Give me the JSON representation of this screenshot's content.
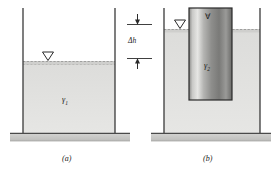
{
  "figure": {
    "title_visible": false,
    "panels": [
      {
        "id": "a",
        "caption": "(a)",
        "fluid_symbol": "γ",
        "fluid_subscript": "1",
        "free_surface_marker": "free-surface-triangle",
        "description_visible_text": "γ₁"
      },
      {
        "id": "b",
        "caption": "(b)",
        "fluid_symbol": "γ",
        "fluid_subscript": "1",
        "block_volume_symbol": "∀",
        "block_weight_symbol": "γ",
        "block_weight_subscript": "2",
        "free_surface_marker": "free-surface-triangle",
        "description_visible_text": "∀, γ₂"
      }
    ],
    "dimension": {
      "label": "Δh",
      "upper_arrow": "arrow-down",
      "lower_arrow": "arrow-up"
    },
    "colors": {
      "fluid": "#e2e2e0",
      "fluid_dark": "#d2d2d0",
      "block_light": "#d8d8d6",
      "block_dark": "#6e6e6c",
      "wall": "#3a3a3a",
      "ground": "#c9c9c7",
      "ground_edge": "#4a4a4a",
      "ink": "#1a1a1a"
    }
  }
}
